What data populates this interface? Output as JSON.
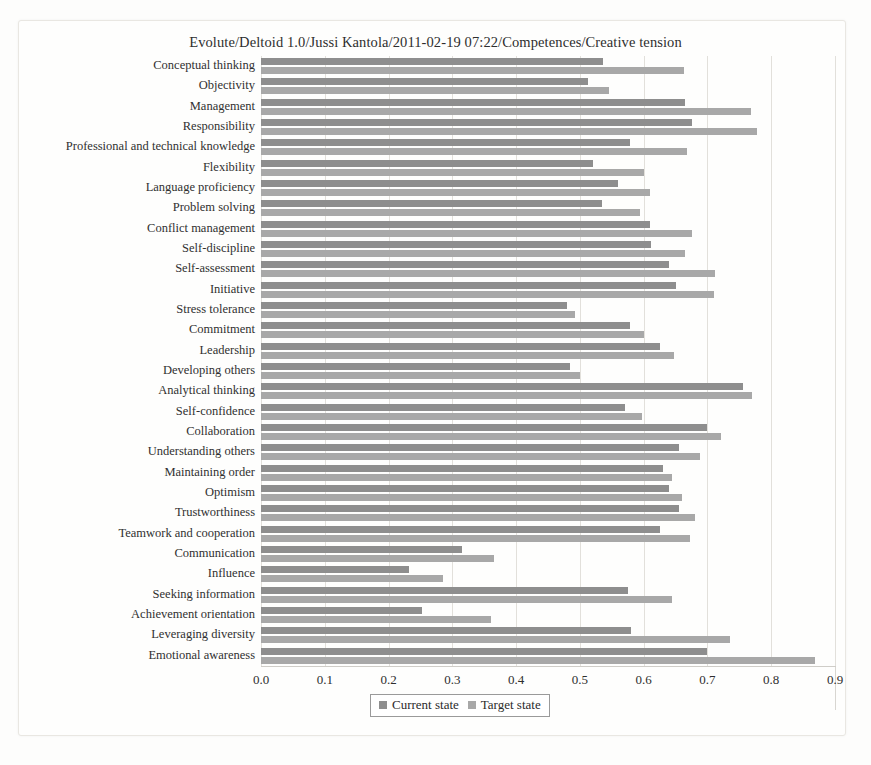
{
  "chart_data": {
    "type": "bar",
    "orientation": "horizontal",
    "title": "Evolute/Deltoid 1.0/Jussi Kantola/2011-02-19 07:22/Competences/Creative tension",
    "xlabel": "",
    "ylabel": "",
    "xlim": [
      0.0,
      0.9
    ],
    "xticks": [
      "0.0",
      "0.1",
      "0.2",
      "0.3",
      "0.4",
      "0.5",
      "0.6",
      "0.7",
      "0.8",
      "0.9"
    ],
    "xtick_values": [
      0.0,
      0.1,
      0.2,
      0.3,
      0.4,
      0.5,
      0.6,
      0.7,
      0.8,
      0.9
    ],
    "grid": true,
    "legend_position": "bottom",
    "categories": [
      "Conceptual thinking",
      "Objectivity",
      "Management",
      "Responsibility",
      "Professional and technical knowledge",
      "Flexibility",
      "Language proficiency",
      "Problem solving",
      "Conflict management",
      "Self-discipline",
      "Self-assessment",
      "Initiative",
      "Stress tolerance",
      "Commitment",
      "Leadership",
      "Developing others",
      "Analytical thinking",
      "Self-confidence",
      "Collaboration",
      "Understanding others",
      "Maintaining order",
      "Optimism",
      "Trustworthiness",
      "Teamwork and cooperation",
      "Communication",
      "Influence",
      "Seeking information",
      "Achievement orientation",
      "Leveraging diversity",
      "Emotional awareness"
    ],
    "series": [
      {
        "name": "Current state",
        "color": "#8e8e8e",
        "values": [
          0.536,
          0.512,
          0.665,
          0.675,
          0.578,
          0.52,
          0.56,
          0.535,
          0.61,
          0.612,
          0.64,
          0.65,
          0.48,
          0.578,
          0.625,
          0.485,
          0.755,
          0.57,
          0.7,
          0.655,
          0.63,
          0.64,
          0.655,
          0.625,
          0.315,
          0.232,
          0.575,
          0.252,
          0.58,
          0.7
        ]
      },
      {
        "name": "Target state",
        "color": "#a8a8a8",
        "values": [
          0.664,
          0.545,
          0.768,
          0.778,
          0.668,
          0.6,
          0.61,
          0.595,
          0.675,
          0.665,
          0.712,
          0.71,
          0.492,
          0.6,
          0.648,
          0.5,
          0.77,
          0.598,
          0.722,
          0.688,
          0.645,
          0.66,
          0.68,
          0.672,
          0.365,
          0.285,
          0.645,
          0.36,
          0.735,
          0.868
        ]
      }
    ]
  },
  "legend": {
    "items": [
      {
        "label": "Current state",
        "swatch": "current"
      },
      {
        "label": "Target state",
        "swatch": "target"
      }
    ]
  }
}
